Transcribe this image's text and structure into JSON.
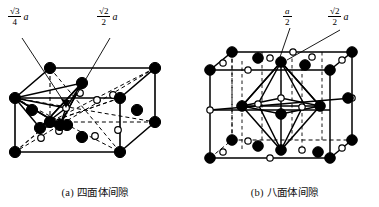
{
  "figure": {
    "title_a": "(a) 四面体间隙",
    "title_b": "(b) 八面体间隙",
    "colors": {
      "line": "#000000",
      "atom_fill": "#000000",
      "interstice_fill": "#ffffff",
      "background": "#ffffff"
    }
  },
  "panel_a": {
    "caption": "(a) 四面体间隙",
    "label_left": {
      "numerator": "√3",
      "denominator": "4",
      "variable": "a"
    },
    "label_right": {
      "numerator": "√2",
      "denominator": "2",
      "variable": "a"
    },
    "legend": {
      "atom": "原子 (实心圆)",
      "site": "四面体间隙 (空心圆)"
    }
  },
  "panel_b": {
    "caption": "(b) 八面体间隙",
    "label_left": {
      "numerator": "a",
      "denominator": "2",
      "variable": ""
    },
    "label_right": {
      "numerator": "√2",
      "denominator": "2",
      "variable": "a"
    },
    "legend": {
      "atom": "原子 (实心圆)",
      "site": "八面体间隙 (空心圆)"
    }
  }
}
